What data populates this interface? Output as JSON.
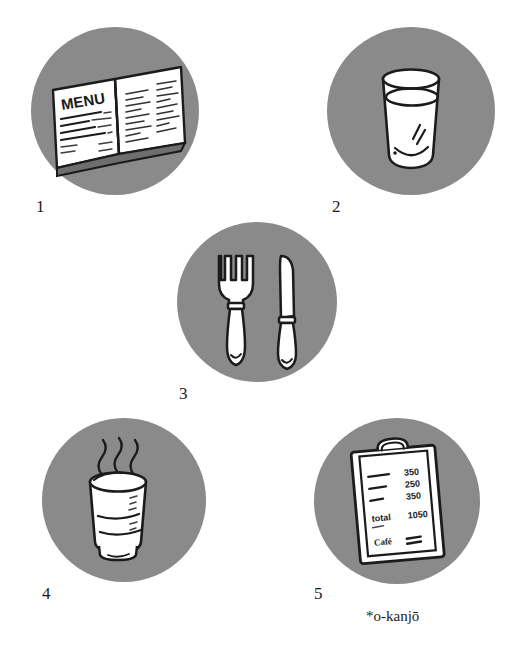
{
  "page": {
    "background_color": "#ffffff",
    "ink_color": "#1b1b1b",
    "disc_color": "#8a8a8a",
    "paper_color": "#ffffff"
  },
  "panels": [
    {
      "number": "1",
      "name": "menu-panel",
      "subject": "open-menu-book",
      "menu": {
        "heading": "MENU",
        "items": [
          "オレンジジュース",
          "ウーロン茶",
          "コーヒー",
          "アイスコーヒー"
        ]
      }
    },
    {
      "number": "2",
      "name": "water-glass-panel",
      "subject": "glass-of-water"
    },
    {
      "number": "3",
      "name": "cutlery-panel",
      "subject": "fork-and-knife"
    },
    {
      "number": "4",
      "name": "hot-drink-panel",
      "subject": "steaming-cup"
    },
    {
      "number": "5",
      "name": "bill-panel",
      "subject": "check-on-clipboard",
      "bill": {
        "lines": [
          {
            "item": "コーヒー",
            "price": "350"
          },
          {
            "item": "ウーロン茶",
            "price": "250"
          },
          {
            "item": "紅茶",
            "price": "350"
          }
        ],
        "total_label": "total",
        "total_value": "1050",
        "footer_left": "Café",
        "footer_right": "領収証"
      }
    }
  ],
  "footnote": {
    "text": "*o-kanjō"
  }
}
